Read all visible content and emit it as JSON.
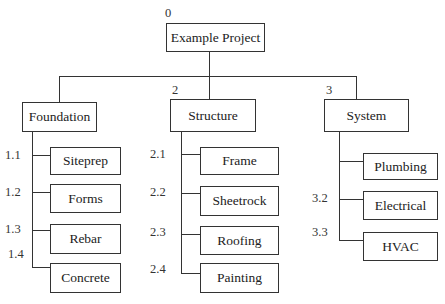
{
  "root": {
    "number": "0",
    "label": "Example Project"
  },
  "branches": [
    {
      "number": "",
      "label": "Foundation",
      "children": [
        {
          "number": "1.1",
          "label": "Siteprep"
        },
        {
          "number": "1.2",
          "label": "Forms"
        },
        {
          "number": "1.3",
          "label": "Rebar"
        },
        {
          "number": "1.4",
          "label": "Concrete"
        }
      ]
    },
    {
      "number": "2",
      "label": "Structure",
      "children": [
        {
          "number": "2.1",
          "label": "Frame"
        },
        {
          "number": "2.2",
          "label": "Sheetrock"
        },
        {
          "number": "2.3",
          "label": "Roofing"
        },
        {
          "number": "2.4",
          "label": "Painting"
        }
      ]
    },
    {
      "number": "3",
      "label": "System",
      "children": [
        {
          "number": "",
          "label": "Plumbing"
        },
        {
          "number": "3.2",
          "label": "Electrical"
        },
        {
          "number": "3.3",
          "label": "HVAC"
        }
      ]
    }
  ]
}
